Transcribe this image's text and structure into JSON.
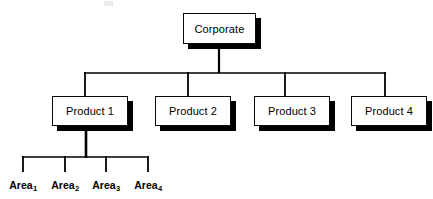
{
  "diagram": {
    "type": "organization-chart",
    "colors": {
      "background": "#ffffff",
      "box_fill": "#ffffff",
      "line": "#000000",
      "border": "#0a0a0a",
      "shadow": "#000000",
      "text": "#000000"
    },
    "levels": [
      {
        "level": 0,
        "name": "corporate-level",
        "nodes": [
          {
            "id": "corporate",
            "label": "Corporate",
            "x": 183,
            "y": 13,
            "w": 73,
            "h": 31
          }
        ]
      },
      {
        "level": 1,
        "name": "product-level",
        "nodes": [
          {
            "id": "product-1",
            "label": "Product 1",
            "x": 52,
            "y": 96,
            "w": 76,
            "h": 30
          },
          {
            "id": "product-2",
            "label": "Product 2",
            "x": 155,
            "y": 96,
            "w": 76,
            "h": 30
          },
          {
            "id": "product-3",
            "label": "Product 3",
            "x": 254,
            "y": 96,
            "w": 76,
            "h": 30
          },
          {
            "id": "product-4",
            "label": "Product 4",
            "x": 351,
            "y": 96,
            "w": 76,
            "h": 30
          }
        ]
      },
      {
        "level": 2,
        "name": "area-level",
        "nodes": [
          {
            "id": "area-1",
            "label": "Area",
            "subscript": "1",
            "x": 23,
            "y": 179
          },
          {
            "id": "area-2",
            "label": "Area",
            "subscript": "2",
            "x": 65,
            "y": 179
          },
          {
            "id": "area-3",
            "label": "Area",
            "subscript": "3",
            "x": 106,
            "y": 179
          },
          {
            "id": "area-4",
            "label": "Area",
            "subscript": "4",
            "x": 148,
            "y": 179
          }
        ]
      }
    ],
    "connectors": {
      "corporate_stem": {
        "x": 219,
        "y1": 49,
        "y2": 73
      },
      "product_bus": {
        "y": 73,
        "x1": 85,
        "x2": 385
      },
      "product_drops": [
        85,
        188,
        285,
        385
      ],
      "product_drop_y": {
        "y1": 73,
        "y2": 96
      },
      "product1_stem": {
        "x": 86,
        "y1": 131,
        "y2": 157
      },
      "area_bus": {
        "y": 157,
        "x1": 23,
        "x2": 148
      },
      "area_drops": [
        23,
        65,
        106,
        148
      ],
      "area_drop_y": {
        "y1": 157,
        "y2": 171
      }
    }
  }
}
